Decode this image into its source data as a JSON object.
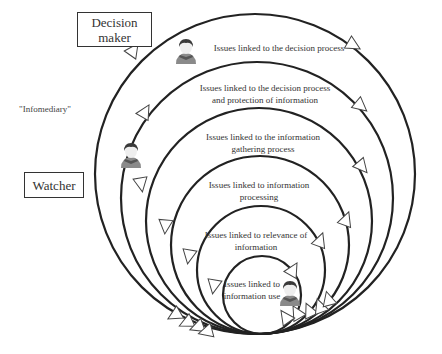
{
  "diagram": {
    "actors": {
      "decision_maker": "Decision\nmaker",
      "decision_maker_line1": "Decision",
      "decision_maker_line2": "maker",
      "watcher": "Watcher",
      "infomediary": "\"Infomediary\""
    },
    "rings": [
      {
        "level": 1,
        "line1": "Issues linked to the decision process",
        "line2": ""
      },
      {
        "level": 2,
        "line1": "Issues linked to the decision process",
        "line2": "and protection of information"
      },
      {
        "level": 3,
        "line1": "Issues linked to the information",
        "line2": "gathering process"
      },
      {
        "level": 4,
        "line1": "Issues linked to information",
        "line2": "processing"
      },
      {
        "level": 5,
        "line1": "Issues linked to relevance of",
        "line2": "information"
      },
      {
        "level": 6,
        "line1": "Issues linked to",
        "line2": "information use"
      }
    ],
    "icons": [
      "person-avatar-icon",
      "arrowhead-icon"
    ],
    "colors": {
      "line": "#222222",
      "text": "#333333",
      "avatar_body": "#8a8a8a",
      "avatar_hair": "#3a3a3a",
      "background": "#ffffff"
    }
  }
}
